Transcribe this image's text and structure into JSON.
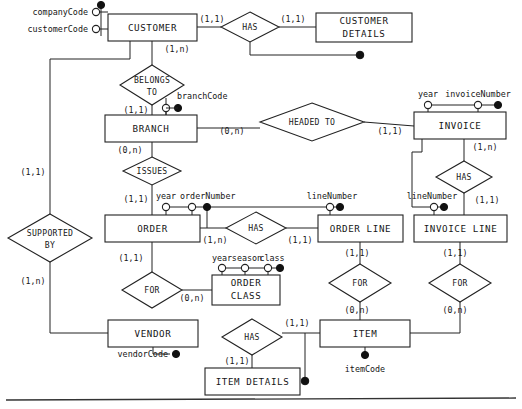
{
  "diagram": {
    "notation": "min-max cardinality (Chen-style ER)",
    "background_color": "#ffffff",
    "line_color": "#222222",
    "entities": [
      {
        "id": "customer",
        "label": "CUSTOMER",
        "x": 108,
        "y": 14,
        "w": 89,
        "h": 27
      },
      {
        "id": "customer_details",
        "label_line1": "CUSTOMER",
        "label_line2": "DETAILS",
        "x": 316,
        "y": 13,
        "w": 96,
        "h": 29
      },
      {
        "id": "branch",
        "label": "BRANCH",
        "x": 105,
        "y": 115,
        "w": 92,
        "h": 27
      },
      {
        "id": "invoice",
        "label": "INVOICE",
        "x": 414,
        "y": 112,
        "w": 92,
        "h": 27
      },
      {
        "id": "order",
        "label": "ORDER",
        "x": 105,
        "y": 215,
        "w": 95,
        "h": 27
      },
      {
        "id": "order_line",
        "label": "ORDER LINE",
        "x": 318,
        "y": 215,
        "w": 85,
        "h": 27
      },
      {
        "id": "invoice_line",
        "label": "INVOICE LINE",
        "x": 414,
        "y": 215,
        "w": 93,
        "h": 27
      },
      {
        "id": "order_class",
        "label_line1": "ORDER",
        "label_line2": "CLASS",
        "x": 212,
        "y": 275,
        "w": 68,
        "h": 30
      },
      {
        "id": "vendor",
        "label": "VENDOR",
        "x": 108,
        "y": 320,
        "w": 90,
        "h": 27
      },
      {
        "id": "item",
        "label": "ITEM",
        "x": 320,
        "y": 320,
        "w": 90,
        "h": 27
      },
      {
        "id": "item_details",
        "label": "ITEM DETAILS",
        "x": 205,
        "y": 368,
        "w": 95,
        "h": 27
      }
    ],
    "relationships": [
      {
        "id": "has_customer_details",
        "label": "HAS",
        "cx": 250,
        "cy": 27,
        "rx": 29,
        "ry": 15
      },
      {
        "id": "belongs_to",
        "label_line1": "BELONGS",
        "label_line2": "TO",
        "cx": 152,
        "cy": 85,
        "rx": 32,
        "ry": 20
      },
      {
        "id": "headed_to",
        "label": "HEADED TO",
        "cx": 312,
        "cy": 122,
        "rx": 52,
        "ry": 19
      },
      {
        "id": "issues",
        "label": "ISSUES",
        "cx": 152,
        "cy": 171,
        "rx": 29,
        "ry": 14
      },
      {
        "id": "has_invoice_line",
        "label": "HAS",
        "cx": 464,
        "cy": 177,
        "rx": 28,
        "ry": 16
      },
      {
        "id": "has_order_line",
        "label": "HAS",
        "cx": 256,
        "cy": 228,
        "rx": 30,
        "ry": 16
      },
      {
        "id": "supported_by",
        "label_line1": "SUPPORTED",
        "label_line2": "BY",
        "cx": 50,
        "cy": 238,
        "rx": 42,
        "ry": 24
      },
      {
        "id": "for_order_class",
        "label": "FOR",
        "cx": 152,
        "cy": 290,
        "rx": 30,
        "ry": 18
      },
      {
        "id": "for_order_line_item",
        "label": "FOR",
        "cx": 360,
        "cy": 283,
        "rx": 31,
        "ry": 19
      },
      {
        "id": "for_invoice_line_item",
        "label": "FOR",
        "cx": 460,
        "cy": 283,
        "rx": 31,
        "ry": 19
      },
      {
        "id": "has_item_details",
        "label": "HAS",
        "cx": 252,
        "cy": 337,
        "rx": 30,
        "ry": 18
      }
    ],
    "attributes": [
      {
        "id": "companyCode",
        "label": "companyCode",
        "entity": "customer",
        "key": true,
        "lx": 62,
        "ly": 12,
        "cx": 90,
        "cy": 12
      },
      {
        "id": "customerCode",
        "label": "customerCode",
        "entity": "customer",
        "key": true,
        "lx": 62,
        "ly": 29,
        "cx": 90,
        "cy": 29
      },
      {
        "id": "branchCode",
        "label": "branchCode",
        "entity": "branch",
        "key": true,
        "lx": 232,
        "ly": 96,
        "cx": 182,
        "cy": 108
      },
      {
        "id": "year_invoice",
        "label": "year",
        "entity": "invoice",
        "key": false,
        "lx": 428,
        "ly": 94,
        "cx": 428,
        "cy": 105
      },
      {
        "id": "invoiceNumber",
        "label": "invoiceNumber",
        "entity": "invoice",
        "key": true,
        "lx": 478,
        "ly": 94,
        "cx": 478,
        "cy": 105
      },
      {
        "id": "year_order",
        "label": "year",
        "entity": "order",
        "key": false,
        "lx": 166,
        "ly": 196,
        "cx": 166,
        "cy": 207
      },
      {
        "id": "orderNumber",
        "label": "orderNumber",
        "entity": "order",
        "key": true,
        "lx": 208,
        "ly": 196,
        "cx": 192,
        "cy": 207
      },
      {
        "id": "lineNumber_ol",
        "label": "lineNumber",
        "entity": "order_line",
        "key": true,
        "lx": 330,
        "ly": 196,
        "cx": 330,
        "cy": 207
      },
      {
        "id": "lineNumber_il",
        "label": "lineNumber",
        "entity": "invoice_line",
        "key": true,
        "lx": 430,
        "ly": 196,
        "cx": 434,
        "cy": 207
      },
      {
        "id": "year_oc",
        "label": "year",
        "entity": "order_class",
        "key": false,
        "lx": 222,
        "ly": 258,
        "cx": 222,
        "cy": 268
      },
      {
        "id": "season_oc",
        "label": "season",
        "entity": "order_class",
        "key": false,
        "lx": 245,
        "ly": 258,
        "cx": 245,
        "cy": 268
      },
      {
        "id": "class_oc",
        "label": "class",
        "entity": "order_class",
        "key": true,
        "lx": 270,
        "ly": 258,
        "cx": 268,
        "cy": 268
      },
      {
        "id": "vendorCode",
        "label": "vendorCode",
        "entity": "vendor",
        "key": true,
        "lx": 168,
        "ly": 354,
        "cx": 176,
        "cy": 354
      },
      {
        "id": "itemCode",
        "label": "itemCode",
        "entity": "item",
        "key": true,
        "lx": 365,
        "ly": 368,
        "cx": 365,
        "cy": 356
      }
    ],
    "cardinalities": [
      {
        "id": "card_cust_has",
        "text": "(1,1)",
        "x": 212,
        "y": 19
      },
      {
        "id": "card_has_custdet",
        "text": "(1,1)",
        "x": 293,
        "y": 19
      },
      {
        "id": "card_cust_belongs",
        "text": "(1,n)",
        "x": 177,
        "y": 49
      },
      {
        "id": "card_belongs_branch",
        "text": "(1,1)",
        "x": 136,
        "y": 110
      },
      {
        "id": "card_branch_headed",
        "text": "(0,n)",
        "x": 232,
        "y": 131
      },
      {
        "id": "card_headed_invoice",
        "text": "(1,1)",
        "x": 390,
        "y": 131
      },
      {
        "id": "card_branch_issues",
        "text": "(0,n)",
        "x": 130,
        "y": 150
      },
      {
        "id": "card_issues_order",
        "text": "(1,1)",
        "x": 136,
        "y": 199
      },
      {
        "id": "card_invoice_has",
        "text": "(1,n)",
        "x": 485,
        "y": 147
      },
      {
        "id": "card_has_invline",
        "text": "(1,1)",
        "x": 487,
        "y": 200
      },
      {
        "id": "card_order_has",
        "text": "(1,n)",
        "x": 215,
        "y": 240
      },
      {
        "id": "card_has_ordline",
        "text": "(1,1)",
        "x": 297,
        "y": 240
      },
      {
        "id": "card_cust_supported",
        "text": "(1,1)",
        "x": 33,
        "y": 172
      },
      {
        "id": "card_supported_vendor",
        "text": "(1,n)",
        "x": 33,
        "y": 281
      },
      {
        "id": "card_order_for",
        "text": "(1,1)",
        "x": 131,
        "y": 258
      },
      {
        "id": "card_for_orderclass",
        "text": "(0,n)",
        "x": 192,
        "y": 298
      },
      {
        "id": "card_ordline_for",
        "text": "(1,1)",
        "x": 357,
        "y": 253
      },
      {
        "id": "card_for_item_o",
        "text": "(0,n)",
        "x": 357,
        "y": 310
      },
      {
        "id": "card_invline_for",
        "text": "(1,1)",
        "x": 455,
        "y": 253
      },
      {
        "id": "card_for_item_i",
        "text": "(0,n)",
        "x": 455,
        "y": 310
      },
      {
        "id": "card_has_item",
        "text": "(1,1)",
        "x": 295,
        "y": 323
      },
      {
        "id": "card_has_itemdet",
        "text": "(1,1)",
        "x": 237,
        "y": 361
      }
    ]
  }
}
